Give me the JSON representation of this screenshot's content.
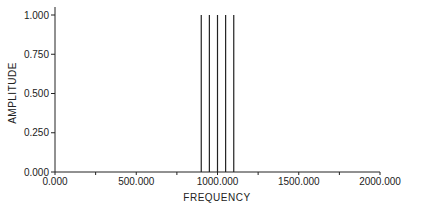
{
  "chart_data": {
    "type": "line",
    "subtype": "stem",
    "title": "",
    "xlabel": "FREQUENCY",
    "ylabel": "AMPLITUDE",
    "xlim": [
      0,
      2000
    ],
    "ylim": [
      0,
      1
    ],
    "grid": false,
    "legend": null,
    "x_ticks": [
      0,
      250,
      500,
      750,
      1000,
      1250,
      1500,
      1750,
      2000
    ],
    "x_tick_labels": [
      "0.000",
      "",
      "500.000",
      "",
      "1000.000",
      "",
      "1500.000",
      "",
      "2000.000"
    ],
    "y_ticks": [
      0,
      0.25,
      0.5,
      0.75,
      1.0
    ],
    "y_tick_labels": [
      "0.000",
      "0.250",
      "0.500",
      "0.750",
      "1.000"
    ],
    "series": [
      {
        "name": "spectrum",
        "x": [
          900,
          950,
          1000,
          1050,
          1100
        ],
        "values": [
          1.0,
          1.0,
          1.0,
          1.0,
          1.0
        ],
        "color": "#222222"
      }
    ]
  }
}
